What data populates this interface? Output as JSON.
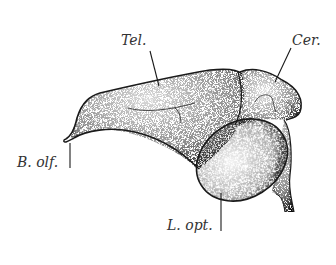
{
  "figure": {
    "labels": [
      {
        "id": "tel",
        "text": "Tel.",
        "x": 121,
        "y": 33
      },
      {
        "id": "cer",
        "text": "Cer.",
        "x": 292,
        "y": 33
      },
      {
        "id": "bolf",
        "text": "B. olf.",
        "x": 17,
        "y": 155
      },
      {
        "id": "lopt",
        "text": "L. opt.",
        "x": 167,
        "y": 218
      }
    ],
    "colors": {
      "ink": "#1a1a1a",
      "label": "#333333",
      "background": "#ffffff"
    }
  }
}
